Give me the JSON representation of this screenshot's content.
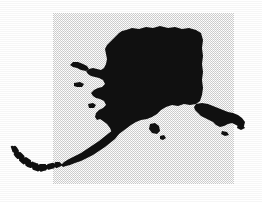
{
  "figure": {
    "caption": "",
    "width": 262,
    "height": 202
  },
  "colors": {
    "background": "#ffffff",
    "backdrop_square": "#d9d9d9",
    "landmass": "#101010"
  },
  "backdrop": {
    "name": "gray-square",
    "x": 53,
    "y": 13,
    "width": 181,
    "height": 171
  },
  "regions": [
    {
      "name": "mainland-alaska",
      "label": "Mainland Alaska"
    },
    {
      "name": "seward-peninsula",
      "label": "Seward Peninsula"
    },
    {
      "name": "alaska-peninsula",
      "label": "Alaska Peninsula"
    },
    {
      "name": "aleutian-islands",
      "label": "Aleutian Islands"
    },
    {
      "name": "southeast-panhandle",
      "label": "Southeast Panhandle"
    },
    {
      "name": "kodiak-island",
      "label": "Kodiak Island"
    },
    {
      "name": "st-lawrence-island",
      "label": "St. Lawrence Island"
    },
    {
      "name": "nunivak-island",
      "label": "Nunivak Island"
    }
  ],
  "map_geometry": {
    "mainland": "M126,30 L132,28 L139,29 L146,27 L153,28 L160,26 L168,28 L175,27 L182,29 L189,28 L196,30 L201,33 L203,40 L202,48 L203,56 L202,64 L203,72 L202,80 L203,88 L202,95 L200,101 L196,104 L190,105 L184,104 L178,106 L172,105 L166,107 L161,110 L157,114 L152,117 L147,119 L141,120 L136,122 L131,125 L127,128 L123,131 L119,134 L115,136 L112,133 L110,128 L107,124 L103,121 L100,119 L97,120 L95,117 L96,113 L99,110 L103,108 L106,105 L104,101 L100,99 L96,98 L93,96 L91,93 L94,90 L98,88 L102,87 L105,84 L103,80 L99,78 L95,77 L91,76 L88,74 L86,71 L89,69 L93,68 L97,69 L101,70 L104,68 L106,64 L107,59 L106,54 L105,49 L107,45 L110,42 L113,39 L116,36 L119,33 L122,31 Z",
    "seward_spur": "M86,71 L81,70 L77,68 L73,67 L70,65 L73,62 L78,62 L83,64 L87,66 L89,69 Z",
    "peninsula": "M119,134 L115,139 L110,143 L105,147 L99,151 L93,155 L87,158 L81,161 L75,163 L70,165 L66,166 L63,167 L61,165 L64,162 L69,159 L75,156 L81,153 L87,149 L93,145 L99,141 L104,137 L109,133 L113,130 L116,131 Z",
    "kodiak": "M150,124 L155,123 L159,126 L160,131 L157,134 L152,133 L149,129 Z",
    "kodiak_small": "M160,136 L164,135 L166,138 L163,140 L160,139 Z",
    "st_lawrence": "M74,83 L80,82 L84,84 L82,87 L77,87 L74,86 Z",
    "nunivak": "M88,104 L93,103 L96,105 L94,108 L89,108 Z",
    "panhandle": "M196,104 L202,103 L208,104 L213,106 L218,108 L223,110 L228,112 L233,113 L238,115 L242,118 L245,122 L244,126 L240,127 L236,125 L232,123 L228,124 L224,126 L220,127 L216,125 L213,122 L209,120 L205,118 L201,116 L198,113 L195,110 L194,107 Z",
    "panhandle_isles": "M230,116 L235,117 L237,120 L234,122 L230,120 Z M238,124 L243,125 L245,128 L241,130 L237,128 Z M222,131 L227,132 L229,135 L225,136 L221,134 Z",
    "aleutians": "M61,165 L56,167 L51,168 L47,169 L43,170 L40,171 L37,170 L34,169 L31,167 L28,166 L25,164 L22,162 L19,159 L16,156 L14,153 L13,150 L12,147 L14,146 L16,148 L18,151 L21,154 L24,157 L27,159 L30,161 L33,163 L36,164 L40,165 L44,165 L48,165 L52,164 L56,163 L59,163 Z"
  },
  "text_labels": []
}
